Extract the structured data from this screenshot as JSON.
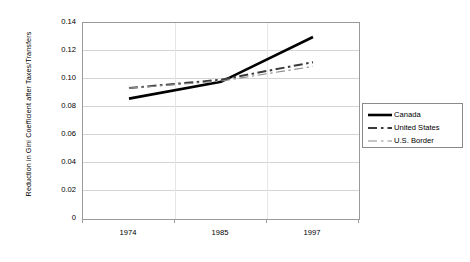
{
  "chart_data": {
    "type": "line",
    "title": "",
    "xlabel": "",
    "ylabel": "Reduction in Gini Coefficient after Taxes/Transfers",
    "categories": [
      "1974",
      "1985",
      "1997"
    ],
    "ylim": [
      0,
      0.14
    ],
    "ytick_labels": [
      "0.14",
      "0.12",
      "0.10",
      "0.08",
      "0.06",
      "0.04",
      "0.02",
      "0"
    ],
    "ytick_values": [
      0.14,
      0.12,
      0.1,
      0.08,
      0.06,
      0.04,
      0.02,
      0
    ],
    "grid": true,
    "legend_position": "right",
    "series": [
      {
        "name": "Canada",
        "values": [
          0.086,
          0.098,
          0.13
        ],
        "style": "solid",
        "width": 2.6,
        "color": "#000000"
      },
      {
        "name": "United States",
        "values": [
          0.0935,
          0.0995,
          0.112
        ],
        "style": "dash-dot",
        "width": 2.0,
        "color": "#3a3a3a"
      },
      {
        "name": "U.S. Border",
        "values": [
          0.0935,
          0.0985,
          0.109
        ],
        "style": "dash-dot",
        "width": 1.1,
        "color": "#8c8c8c"
      }
    ]
  },
  "legend": {
    "items": [
      {
        "label": "Canada"
      },
      {
        "label": "United States"
      },
      {
        "label": "U.S. Border"
      }
    ]
  },
  "colors": {
    "background": "#ffffff",
    "grid": "#d4d4d4",
    "axis": "#9a9a9a",
    "text": "#000000"
  }
}
